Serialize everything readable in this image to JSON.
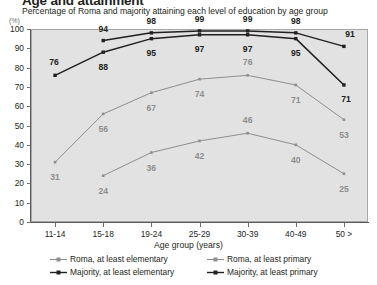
{
  "chart_data": {
    "type": "line",
    "title": "Age and attainment",
    "subtitle": "Percentage of Roma and majority attaining each level of education by age group",
    "xlabel": "Age group (years)",
    "ylabel": "",
    "yunit": "(%)",
    "ylim": [
      0,
      100
    ],
    "ytick_labels": [
      "0",
      "10",
      "20",
      "30",
      "40",
      "50",
      "60",
      "70",
      "80",
      "90",
      "100"
    ],
    "grid": false,
    "legend_position": "bottom",
    "categories": [
      "11-14",
      "15-18",
      "19-24",
      "25-29",
      "30-39",
      "40-49",
      "50 >"
    ],
    "series": [
      {
        "name": "Roma, at least elementary",
        "color": "#8d8e90",
        "values": [
          null,
          24,
          36,
          42,
          46,
          40,
          25
        ]
      },
      {
        "name": "Majority, at least elementary",
        "color": "#231f20",
        "values": [
          76,
          88,
          95,
          97,
          97,
          95,
          71
        ]
      },
      {
        "name": "Roma, at least primary",
        "color": "#8d8e90",
        "values": [
          31,
          56,
          67,
          74,
          76,
          71,
          53
        ]
      },
      {
        "name": "Majority, at least primary",
        "color": "#231f20",
        "values": [
          null,
          94,
          98,
          99,
          99,
          98,
          91
        ]
      }
    ]
  },
  "legend": {
    "items": [
      {
        "label": "Roma, at least elementary",
        "color": "#8d8e90"
      },
      {
        "label": "Majority, at least elementary",
        "color": "#231f20"
      },
      {
        "label": "Roma, at least primary",
        "color": "#8d8e90"
      },
      {
        "label": "Majority, at least primary",
        "color": "#231f20"
      }
    ]
  },
  "colors": {
    "roma": "#8d8e90",
    "majority": "#231f20",
    "plot_background": "#e2e2e2",
    "axis": "#58595b",
    "page_background": "#ffffff"
  }
}
